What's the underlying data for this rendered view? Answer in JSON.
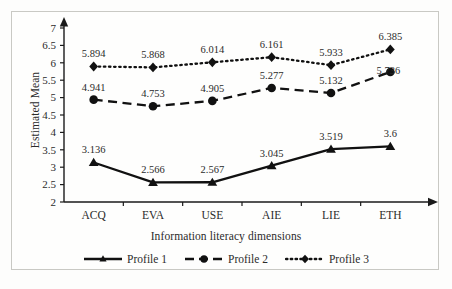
{
  "chart_data": {
    "type": "line",
    "title": "",
    "xlabel": "Information literacy dimensions",
    "ylabel": "Estimated Mean",
    "categories": [
      "ACQ",
      "EVA",
      "USE",
      "AIE",
      "LIE",
      "ETH"
    ],
    "ylim": [
      2,
      7
    ],
    "yticks": [
      "2",
      "2.5",
      "3",
      "3.5",
      "4",
      "4.5",
      "5",
      "5.5",
      "6",
      "6.5",
      "7"
    ],
    "grid": false,
    "legend_position": "bottom",
    "series": [
      {
        "name": "Profile 1",
        "marker": "triangle",
        "line_style": "solid",
        "values": [
          3.136,
          2.566,
          2.567,
          3.045,
          3.519,
          3.6
        ],
        "labels": [
          "3.136",
          "2.566",
          "2.567",
          "3.045",
          "3.519",
          "3.6"
        ]
      },
      {
        "name": "Profile 2",
        "marker": "circle",
        "line_style": "dashed",
        "values": [
          4.941,
          4.753,
          4.905,
          5.277,
          5.132,
          5.736
        ],
        "labels": [
          "4.941",
          "4.753",
          "4.905",
          "5.277",
          "5.132",
          "5.736"
        ]
      },
      {
        "name": "Profile 3",
        "marker": "diamond",
        "line_style": "dotted",
        "values": [
          5.894,
          5.868,
          6.014,
          6.161,
          5.933,
          6.385
        ],
        "labels": [
          "5.894",
          "5.868",
          "6.014",
          "6.161",
          "5.933",
          "6.385"
        ]
      }
    ],
    "colors": {
      "line": "#111111",
      "text": "#2b2b2b",
      "axis": "#1a1a1a",
      "frame": "#c9c9c4",
      "background": "#fefefd"
    }
  },
  "legend": {
    "items": [
      {
        "label": "Profile 1"
      },
      {
        "label": "Profile 2"
      },
      {
        "label": "Profile 3"
      }
    ]
  }
}
